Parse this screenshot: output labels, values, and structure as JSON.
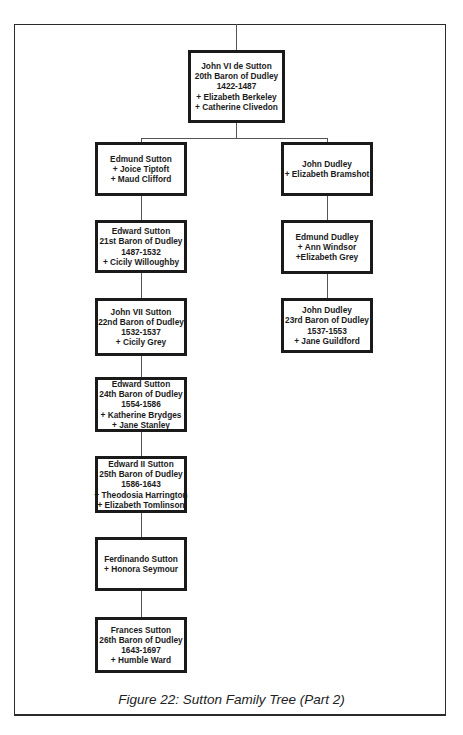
{
  "figure": {
    "caption": "Figure 22: Sutton Family Tree (Part 2)",
    "colors": {
      "box_border": "#1a1a1a",
      "connector": "#555555",
      "background": "#ffffff"
    }
  },
  "tree": {
    "root": {
      "lines": [
        "John VI de Sutton",
        "20th Baron of Dudley",
        "1422-1487",
        "+ Elizabeth Berkeley",
        "+ Catherine Clivedon"
      ]
    },
    "left_branch": [
      {
        "lines": [
          "Edmund Sutton",
          "+ Joice Tiptoft",
          "+ Maud Clifford"
        ]
      },
      {
        "lines": [
          "Edward Sutton",
          "21st Baron of Dudley",
          "1487-1532",
          "+ Cicily Willoughby"
        ]
      },
      {
        "lines": [
          "John VII Sutton",
          "22nd Baron of Dudley",
          "1532-1537",
          "+ Cicily Grey"
        ]
      },
      {
        "lines": [
          "Edward Sutton",
          "24th Baron of Dudley",
          "1554-1586",
          "+ Katherine Brydges",
          "+ Jane Stanley"
        ]
      },
      {
        "lines": [
          "Edward II Sutton",
          "25th Baron of Dudley",
          "1586-1643",
          "+ Theodosia Harrington",
          "+ Elizabeth Tomlinson"
        ]
      },
      {
        "lines": [
          "Ferdinando Sutton",
          "+ Honora Seymour"
        ]
      },
      {
        "lines": [
          "Frances Sutton",
          "26th Baron of Dudley",
          "1643-1697",
          "+ Humble Ward"
        ]
      }
    ],
    "right_branch": [
      {
        "lines": [
          "John Dudley",
          "+ Elizabeth Bramshot"
        ]
      },
      {
        "lines": [
          "Edmund Dudley",
          "+ Ann Windsor",
          "+Elizabeth Grey"
        ]
      },
      {
        "lines": [
          "John Dudley",
          "23rd Baron of Dudley",
          "1537-1553",
          "+ Jane Guildford"
        ]
      }
    ]
  }
}
